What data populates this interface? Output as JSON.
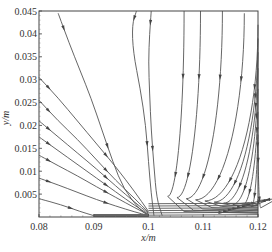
{
  "chart_data": {
    "type": "streamline",
    "title": "",
    "xlabel": "x/m",
    "ylabel": "y/m",
    "xlim": [
      0.08,
      0.12
    ],
    "ylim": [
      0,
      0.045
    ],
    "x_ticks": [
      0.08,
      0.09,
      0.1,
      0.11,
      0.12
    ],
    "x_tick_labels": [
      "0.08",
      "0.09",
      "0.1",
      "0.11",
      "0.12"
    ],
    "y_ticks": [
      0.005,
      0.01,
      0.015,
      0.02,
      0.025,
      0.03,
      0.035,
      0.04,
      0.045
    ],
    "y_tick_labels": [
      "0.005",
      "0.01",
      "0.015",
      "0.02",
      "0.025",
      "0.03",
      "0.035",
      "0.04",
      "0.045"
    ],
    "grid": false,
    "legend": null,
    "wall_segment": {
      "x_start": 0.09,
      "x_end": 0.1,
      "y": 0,
      "color": "#666666"
    },
    "streamlines": [
      [
        [
          0.0835,
          0.0445
        ],
        [
          0.0855,
          0.038
        ],
        [
          0.0875,
          0.032
        ],
        [
          0.0895,
          0.026
        ],
        [
          0.0915,
          0.019
        ],
        [
          0.0935,
          0.012
        ],
        [
          0.0955,
          0.006
        ],
        [
          0.0985,
          0.0015
        ],
        [
          0.1,
          0.0003
        ]
      ],
      [
        [
          0.0978,
          0.045
        ],
        [
          0.097,
          0.042
        ],
        [
          0.0972,
          0.036
        ],
        [
          0.0985,
          0.028
        ],
        [
          0.0995,
          0.02
        ],
        [
          0.1,
          0.012
        ],
        [
          0.1005,
          0.005
        ],
        [
          0.101,
          0.0003
        ]
      ],
      [
        [
          0.1005,
          0.045
        ],
        [
          0.1002,
          0.04
        ],
        [
          0.1,
          0.034
        ],
        [
          0.1002,
          0.027
        ],
        [
          0.1005,
          0.019
        ],
        [
          0.101,
          0.011
        ],
        [
          0.1015,
          0.004
        ],
        [
          0.1025,
          0.0003
        ]
      ],
      [
        [
          0.0815,
          0.045
        ],
        [
          0.0,
          0.0
        ]
      ],
      [
        [
          0.08,
          0.0305
        ],
        [
          0.0835,
          0.026
        ],
        [
          0.087,
          0.021
        ],
        [
          0.0905,
          0.016
        ],
        [
          0.094,
          0.011
        ],
        [
          0.0975,
          0.0055
        ],
        [
          0.1,
          0.0012
        ]
      ],
      [
        [
          0.08,
          0.0255
        ],
        [
          0.0835,
          0.021
        ],
        [
          0.087,
          0.017
        ],
        [
          0.0905,
          0.0125
        ],
        [
          0.094,
          0.008
        ],
        [
          0.0975,
          0.004
        ],
        [
          0.1,
          0.001
        ]
      ],
      [
        [
          0.08,
          0.021
        ],
        [
          0.0835,
          0.0175
        ],
        [
          0.087,
          0.014
        ],
        [
          0.0905,
          0.0105
        ],
        [
          0.094,
          0.0068
        ],
        [
          0.0975,
          0.0032
        ],
        [
          0.1,
          0.0008
        ]
      ],
      [
        [
          0.08,
          0.0175
        ],
        [
          0.0835,
          0.0145
        ],
        [
          0.087,
          0.0115
        ],
        [
          0.0905,
          0.0085
        ],
        [
          0.094,
          0.0055
        ],
        [
          0.0975,
          0.0025
        ],
        [
          0.1,
          0.0006
        ]
      ],
      [
        [
          0.08,
          0.0135
        ],
        [
          0.0835,
          0.0112
        ],
        [
          0.087,
          0.009
        ],
        [
          0.0905,
          0.0066
        ],
        [
          0.094,
          0.0043
        ],
        [
          0.0975,
          0.002
        ],
        [
          0.1,
          0.0005
        ]
      ],
      [
        [
          0.08,
          0.0085
        ],
        [
          0.0835,
          0.007
        ],
        [
          0.087,
          0.0054
        ],
        [
          0.0905,
          0.0038
        ],
        [
          0.094,
          0.0024
        ],
        [
          0.0975,
          0.0011
        ],
        [
          0.1,
          0.0003
        ]
      ],
      [
        [
          0.08,
          0.004
        ],
        [
          0.084,
          0.0027
        ],
        [
          0.0875,
          0.0012
        ],
        [
          0.09,
          0.0003
        ]
      ]
    ]
  },
  "figure": {
    "x_axis_title": "x/m",
    "y_axis_title": "y/m"
  }
}
